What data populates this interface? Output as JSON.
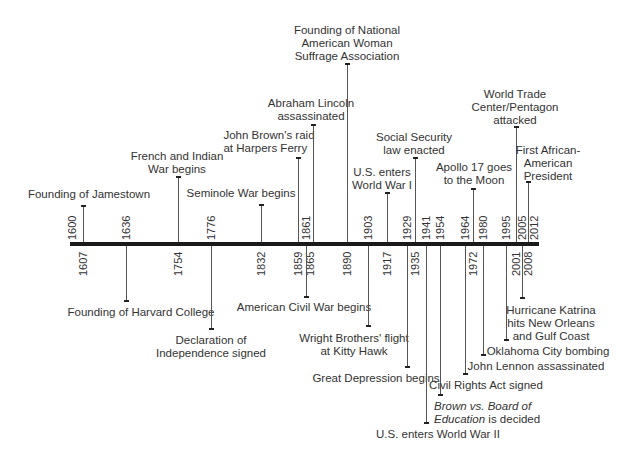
{
  "chart_data": {
    "type": "timeline",
    "title": "",
    "axis_range": [
      1600,
      2012
    ],
    "axis_years_above": [
      "1600",
      "1636",
      "1776",
      "1861",
      "1903",
      "1929",
      "1941",
      "1954",
      "1964",
      "1980",
      "1995",
      "2005",
      "2012"
    ],
    "axis_years_below": [
      "1607",
      "1754",
      "1832",
      "1859",
      "1865",
      "1890",
      "1917",
      "1935",
      "1972",
      "2001",
      "2008"
    ],
    "events": [
      {
        "year": "1607",
        "side": "above",
        "label": "Founding of Jamestown"
      },
      {
        "year": "1636",
        "side": "below",
        "label": "Founding of Harvard College"
      },
      {
        "year": "1754",
        "side": "above",
        "label": "French and Indian War begins"
      },
      {
        "year": "1776",
        "side": "below",
        "label": "Declaration of Independence signed"
      },
      {
        "year": "1832",
        "side": "above",
        "label": "Seminole War begins"
      },
      {
        "year": "1859",
        "side": "above",
        "label": "John Brown's raid at Harpers Ferry"
      },
      {
        "year": "1861",
        "side": "below",
        "label": "American Civil War begins"
      },
      {
        "year": "1865",
        "side": "above",
        "label": "Abraham Lincoln assassinated"
      },
      {
        "year": "1890",
        "side": "above",
        "label": "Founding of National American Woman Suffrage Association"
      },
      {
        "year": "1903",
        "side": "below",
        "label": "Wright Brothers' flight at Kitty Hawk"
      },
      {
        "year": "1917",
        "side": "above",
        "label": "U.S. enters World War I"
      },
      {
        "year": "1929",
        "side": "below",
        "label": "Great Depression begins"
      },
      {
        "year": "1935",
        "side": "above",
        "label": "Social Security law enacted"
      },
      {
        "year": "1941",
        "side": "below",
        "label": "U.S. enters World War II"
      },
      {
        "year": "1954",
        "side": "below",
        "label": "Brown vs. Board of Education is decided"
      },
      {
        "year": "1964",
        "side": "below",
        "label": "Civil Rights Act signed"
      },
      {
        "year": "1972",
        "side": "above",
        "label": "Apollo 17 goes to the Moon"
      },
      {
        "year": "1980",
        "side": "below",
        "label": "John Lennon assassinated"
      },
      {
        "year": "1995",
        "side": "below",
        "label": "Oklahoma City bombing"
      },
      {
        "year": "2001",
        "side": "above",
        "label": "World Trade Center/Pentagon attacked"
      },
      {
        "year": "2005",
        "side": "below",
        "label": "Hurricane Katrina hits New Orleans and Gulf Coast"
      },
      {
        "year": "2008",
        "side": "above",
        "label": "First African-American President"
      }
    ]
  },
  "years": {
    "y1600": "1600",
    "y1607": "1607",
    "y1636": "1636",
    "y1754": "1754",
    "y1776": "1776",
    "y1832": "1832",
    "y1859": "1859",
    "y1861": "1861",
    "y1865": "1865",
    "y1890": "1890",
    "y1903": "1903",
    "y1917": "1917",
    "y1929": "1929",
    "y1935": "1935",
    "y1941": "1941",
    "y1954": "1954",
    "y1964": "1964",
    "y1972": "1972",
    "y1980": "1980",
    "y1995": "1995",
    "y2001": "2001",
    "y2005": "2005",
    "y2008": "2008",
    "y2012": "2012"
  },
  "labels": {
    "jamestown": [
      "Founding of Jamestown"
    ],
    "harvard": [
      "Founding of Harvard College"
    ],
    "french_indian": [
      "French and Indian",
      "War begins"
    ],
    "declaration": [
      "Declaration of",
      "Independence signed"
    ],
    "seminole": [
      "Seminole War begins"
    ],
    "john_brown": [
      "John Brown's raid",
      "at Harpers Ferry"
    ],
    "civil_war": [
      "American Civil War begins"
    ],
    "lincoln": [
      "Abraham Lincoln",
      "assassinated"
    ],
    "nawsa": [
      "Founding of National",
      "American Woman",
      "Suffrage Association"
    ],
    "wright": [
      "Wright Brothers' flight",
      "at Kitty Hawk"
    ],
    "wwi": [
      "U.S. enters",
      "World War I"
    ],
    "depression": [
      "Great Depression begins"
    ],
    "social_security": [
      "Social Security",
      "law enacted"
    ],
    "wwii": [
      "U.S. enters World War II"
    ],
    "brown_board": {
      "italic1": "Brown vs. Board of",
      "italic2": "Education",
      "rest": " is decided"
    },
    "civil_rights": [
      "Civil Rights Act signed"
    ],
    "apollo": [
      "Apollo 17 goes",
      "to the Moon"
    ],
    "lennon": [
      "John Lennon assassinated"
    ],
    "okc": [
      "Oklahoma City bombing"
    ],
    "wtc": [
      "World Trade",
      "Center/Pentagon",
      "attacked"
    ],
    "katrina": [
      "Hurricane Katrina",
      "hits New Orleans",
      "and Gulf Coast"
    ],
    "obama": [
      "First African-",
      "American",
      "President"
    ]
  }
}
